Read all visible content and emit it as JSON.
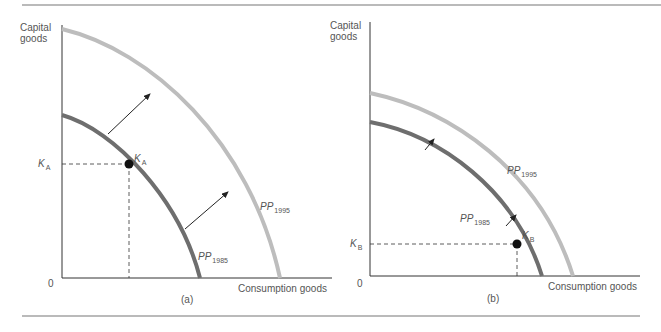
{
  "figure": {
    "panels": [
      {
        "id": "a",
        "caption": "(a)",
        "y_axis_label": [
          "Capital",
          "goods"
        ],
        "x_axis_label": "Consumption goods",
        "origin_label": "0",
        "curves": [
          {
            "name": "PP",
            "year": "1985",
            "color": "#6e6e6e",
            "role": "initial frontier"
          },
          {
            "name": "PP",
            "year": "1995",
            "color": "#bdbdbd",
            "role": "shifted frontier"
          }
        ],
        "point": {
          "name": "K",
          "sub": "A"
        },
        "axis_marker": {
          "name": "K",
          "sub": "A"
        },
        "shift_arrows": 2,
        "description": "High capital investment: large outward shift of frontier"
      },
      {
        "id": "b",
        "caption": "(b)",
        "y_axis_label": [
          "Capital",
          "goods"
        ],
        "x_axis_label": "Consumption goods",
        "origin_label": "0",
        "curves": [
          {
            "name": "PP",
            "year": "1985",
            "color": "#6e6e6e",
            "role": "initial frontier"
          },
          {
            "name": "PP",
            "year": "1995",
            "color": "#bdbdbd",
            "role": "shifted frontier"
          }
        ],
        "point": {
          "name": "K",
          "sub": "B"
        },
        "axis_marker": {
          "name": "K",
          "sub": "B"
        },
        "shift_arrows": 2,
        "description": "Low capital investment: small outward shift of frontier"
      }
    ]
  },
  "colors": {
    "dark_curve": "#6e6e6e",
    "light_curve": "#bdbdbd",
    "axis": "#333333",
    "rule": "#777777"
  }
}
